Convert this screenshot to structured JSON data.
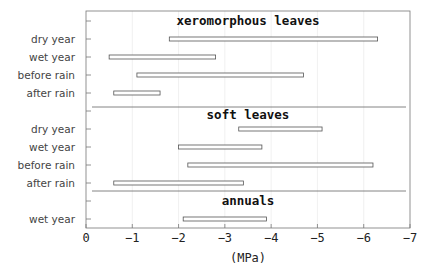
{
  "chart_data": {
    "type": "bar",
    "orientation": "horizontal-range",
    "title": "",
    "xlabel": "(MPa)",
    "ylabel": "",
    "xlim": [
      0,
      -7
    ],
    "xticks": [
      "0",
      "-1",
      "-2",
      "-3",
      "-4",
      "-5",
      "-6",
      "-7"
    ],
    "grid": true,
    "groups": [
      {
        "name": "xeromorphous leaves",
        "rows": [
          {
            "label": "dry year",
            "min": -1.8,
            "max": -6.3
          },
          {
            "label": "wet year",
            "min": -0.5,
            "max": -2.8
          },
          {
            "label": "before rain",
            "min": -1.1,
            "max": -4.7
          },
          {
            "label": "after rain",
            "min": -0.6,
            "max": -1.6
          }
        ]
      },
      {
        "name": "soft leaves",
        "rows": [
          {
            "label": "dry year",
            "min": -3.3,
            "max": -5.1
          },
          {
            "label": "wet year",
            "min": -2.0,
            "max": -3.8
          },
          {
            "label": "before rain",
            "min": -2.2,
            "max": -6.2
          },
          {
            "label": "after rain",
            "min": -0.6,
            "max": -3.4
          }
        ]
      },
      {
        "name": "annuals",
        "rows": [
          {
            "label": "wet year",
            "min": -2.1,
            "max": -3.9
          }
        ]
      }
    ]
  }
}
